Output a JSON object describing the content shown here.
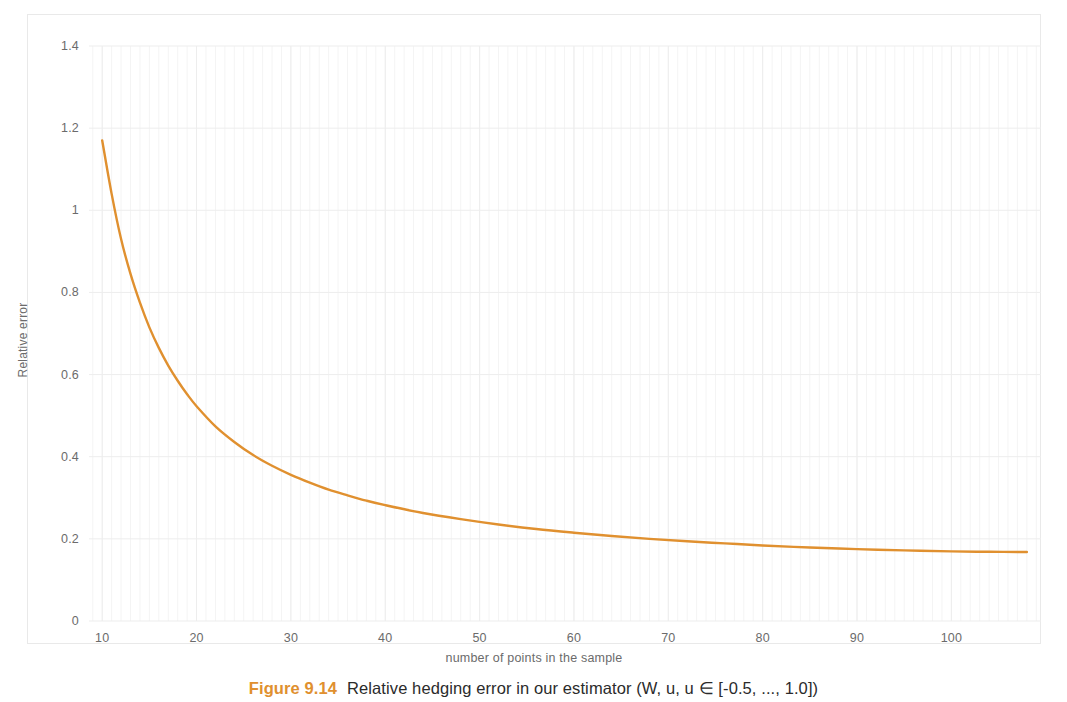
{
  "chart_data": {
    "type": "line",
    "title": "",
    "xlabel": "number of points in the sample",
    "ylabel": "Relative error",
    "xlim": [
      8.6,
      109.5
    ],
    "ylim": [
      0,
      1.4
    ],
    "grid": true,
    "grid_minor_vertical": true,
    "legend": "none",
    "line_color": "#E0902F",
    "line_width": 2.4,
    "xticks": [
      10,
      20,
      30,
      40,
      50,
      60,
      70,
      80,
      90,
      100
    ],
    "xtick_labels": [
      "10",
      "20",
      "30",
      "40",
      "50",
      "60",
      "70",
      "80",
      "90",
      "100"
    ],
    "yticks": [
      0,
      0.2,
      0.4,
      0.6,
      0.8,
      1,
      1.2,
      1.4
    ],
    "ytick_labels": [
      "0",
      "0.2",
      "0.4",
      "0.6",
      "0.8",
      "1",
      "1.2",
      "1.4"
    ],
    "series": [
      {
        "name": "Relative error",
        "x": [
          10,
          11,
          12,
          13,
          14,
          15,
          16,
          17,
          18,
          19,
          20,
          22,
          24,
          26,
          28,
          30,
          32,
          34,
          36,
          38,
          40,
          44,
          48,
          52,
          56,
          60,
          64,
          68,
          72,
          76,
          80,
          85,
          90,
          95,
          100,
          104,
          108
        ],
        "y": [
          1.17,
          1.04,
          0.93,
          0.845,
          0.775,
          0.715,
          0.665,
          0.622,
          0.585,
          0.552,
          0.523,
          0.474,
          0.436,
          0.404,
          0.378,
          0.356,
          0.337,
          0.32,
          0.306,
          0.293,
          0.282,
          0.263,
          0.248,
          0.235,
          0.224,
          0.215,
          0.207,
          0.2,
          0.194,
          0.189,
          0.184,
          0.179,
          0.175,
          0.172,
          0.1695,
          0.1685,
          0.168
        ]
      }
    ]
  },
  "axes": {
    "x_title": "number of points in the sample",
    "y_title": "Relative error"
  },
  "caption": {
    "number": "Figure 9.14",
    "text": "Relative hedging error in our estimator (W, u, u ∈ [-0.5, ..., 1.0])"
  }
}
